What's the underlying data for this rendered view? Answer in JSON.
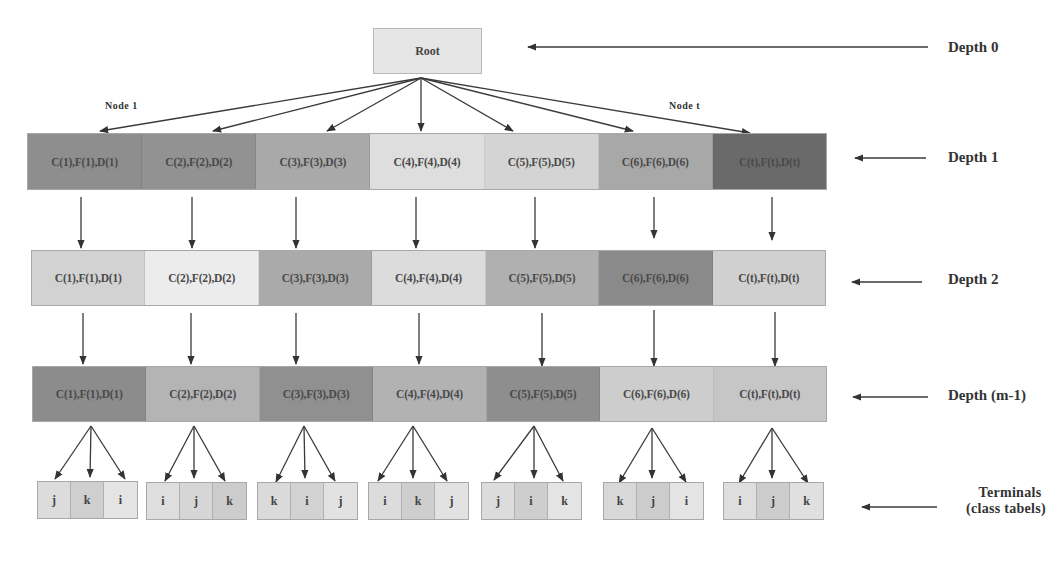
{
  "diagram": {
    "root": {
      "label": "Root"
    },
    "node_labels": {
      "first": "Node 1",
      "last": "Node t"
    },
    "depth_labels": {
      "depth0": "Depth 0",
      "depth1": "Depth 1",
      "depth2": "Depth 2",
      "depth_m1": "Depth (m-1)",
      "terminals_line1": "Terminals",
      "terminals_line2": "(class tabels)"
    },
    "depth1": {
      "cells": [
        {
          "label": "C(1),F(1),D(1)",
          "color": "#8e8e8e"
        },
        {
          "label": "C(2),F(2),D(2)",
          "color": "#929292"
        },
        {
          "label": "C(3),F(3),D(3)",
          "color": "#a9a9a9"
        },
        {
          "label": "C(4),F(4),D(4)",
          "color": "#dedede"
        },
        {
          "label": "C(5),F(5),D(5)",
          "color": "#d4d4d4"
        },
        {
          "label": "C(6),F(6),D(6)",
          "color": "#a8a8a8"
        },
        {
          "label": "C(t),F(t),D(t)",
          "color": "#6a6a6a"
        }
      ]
    },
    "depth2": {
      "cells": [
        {
          "label": "C(1),F(1),D(1)",
          "color": "#d2d2d2"
        },
        {
          "label": "C(2),F(2),D(2)",
          "color": "#ececec"
        },
        {
          "label": "C(3),F(3),D(3)",
          "color": "#aaaaaa"
        },
        {
          "label": "C(4),F(4),D(4)",
          "color": "#dcdcdc"
        },
        {
          "label": "C(5),F(5),D(5)",
          "color": "#b0b0b0"
        },
        {
          "label": "C(6),F(6),D(6)",
          "color": "#8a8a8a"
        },
        {
          "label": "C(t),F(t),D(t)",
          "color": "#d0d0d0"
        }
      ]
    },
    "depth_m1": {
      "cells": [
        {
          "label": "C(1),F(1),D(1)",
          "color": "#8c8c8c"
        },
        {
          "label": "C(2),F(2),D(2)",
          "color": "#b4b4b4"
        },
        {
          "label": "C(3),F(3),D(3)",
          "color": "#909090"
        },
        {
          "label": "C(4),F(4),D(4)",
          "color": "#b2b2b2"
        },
        {
          "label": "C(5),F(5),D(5)",
          "color": "#8e8e8e"
        },
        {
          "label": "C(6),F(6),D(6)",
          "color": "#cdcdcd"
        },
        {
          "label": "C(t),F(t),D(t)",
          "color": "#c6c6c6"
        }
      ]
    },
    "terminals": [
      {
        "cells": [
          "j",
          "k",
          "i"
        ],
        "colors": [
          "#dcdcdc",
          "#cfcfcf",
          "#e4e4e4"
        ]
      },
      {
        "cells": [
          "i",
          "j",
          "k"
        ],
        "colors": [
          "#dedede",
          "#d6d6d6",
          "#cccccc"
        ]
      },
      {
        "cells": [
          "k",
          "i",
          "j"
        ],
        "colors": [
          "#dadada",
          "#d2d2d2",
          "#e2e2e2"
        ]
      },
      {
        "cells": [
          "i",
          "k",
          "j"
        ],
        "colors": [
          "#dcdcdc",
          "#cecece",
          "#e2e2e2"
        ]
      },
      {
        "cells": [
          "j",
          "i",
          "k"
        ],
        "colors": [
          "#dcdcdc",
          "#cecece",
          "#e4e4e4"
        ]
      },
      {
        "cells": [
          "k",
          "j",
          "i"
        ],
        "colors": [
          "#d8d8d8",
          "#cccccc",
          "#e4e4e4"
        ]
      },
      {
        "cells": [
          "i",
          "j",
          "k"
        ],
        "colors": [
          "#dedede",
          "#cccccc",
          "#e0e0e0"
        ]
      }
    ]
  }
}
